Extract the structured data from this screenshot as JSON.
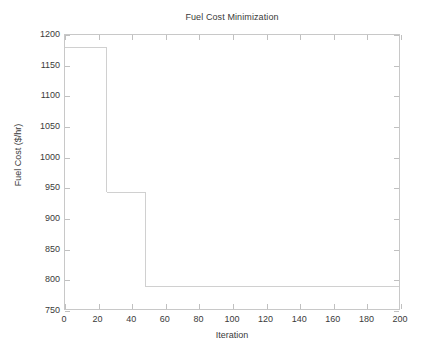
{
  "chart_data": {
    "type": "line",
    "title": "Fuel Cost Minimization",
    "xlabel": "Iteration",
    "ylabel": "Fuel Cost ($/hr)",
    "xlim": [
      0,
      200
    ],
    "ylim": [
      750,
      1200
    ],
    "xticks": [
      0,
      20,
      40,
      60,
      80,
      100,
      120,
      140,
      160,
      180,
      200
    ],
    "yticks": [
      750,
      800,
      850,
      900,
      950,
      1000,
      1050,
      1100,
      1150,
      1200
    ],
    "grid": false,
    "legend": null,
    "series": [
      {
        "name": "Best Fuel Cost",
        "style": "step-post",
        "color": "#d0d0d0",
        "x": [
          0,
          25,
          25,
          48,
          48,
          200
        ],
        "values": [
          1179,
          1179,
          942,
          942,
          787,
          787
        ]
      }
    ],
    "step_levels": [
      {
        "from_iteration": 0,
        "to_iteration": 25,
        "cost": 1179
      },
      {
        "from_iteration": 25,
        "to_iteration": 48,
        "cost": 942
      },
      {
        "from_iteration": 48,
        "to_iteration": 200,
        "cost": 787
      }
    ],
    "annotations": [],
    "axis_color": "#c8c8c8",
    "text_color": "#3a3a3a",
    "background": "#ffffff"
  }
}
